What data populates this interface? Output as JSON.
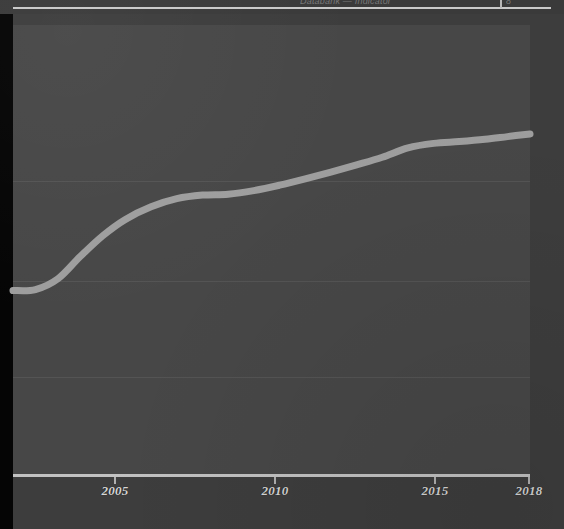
{
  "header": {
    "clipped_title": "Databank — Indicator",
    "clipped_value": "8",
    "divider_icon": "vertical-divider-icon"
  },
  "chart_data": {
    "type": "line",
    "title": "",
    "subtitle": "",
    "xlabel": "",
    "ylabel": "",
    "legend": [],
    "grid": true,
    "legend_position": "none",
    "xlim": [
      2001.9,
      2018
    ],
    "ylim": [
      0,
      100
    ],
    "xticks": [
      2005,
      2010,
      2015,
      2018
    ],
    "xtick_labels": [
      "2005",
      "2010",
      "2015",
      "2018"
    ],
    "yticks": [],
    "ytick_labels": [],
    "gridlines_y": [
      20,
      40,
      60,
      80
    ],
    "series": [
      {
        "name": "series-1",
        "color": "#9e9e9e",
        "x": [
          2001.9,
          2002.6,
          2003.3,
          2004.0,
          2004.7,
          2005.4,
          2006.2,
          2007.0,
          2007.8,
          2008.6,
          2009.4,
          2010.2,
          2011.0,
          2011.8,
          2012.6,
          2013.4,
          2014.2,
          2015.0,
          2015.8,
          2016.6,
          2017.3,
          2018.0
        ],
        "values": [
          41.0,
          41.2,
          43.6,
          48.6,
          53.2,
          56.8,
          59.6,
          61.4,
          62.2,
          62.4,
          63.2,
          64.4,
          65.8,
          67.3,
          68.9,
          70.6,
          72.7,
          73.7,
          74.1,
          74.6,
          75.2,
          75.8
        ]
      }
    ]
  },
  "colors": {
    "page_background": "#3d3d3d",
    "plot_background": "#474747",
    "gridline": "#545454",
    "axis": "#c2c2c2",
    "series_line": "#9e9e9e",
    "tick_label": "#d6d6d6",
    "gutter": "#050505"
  }
}
